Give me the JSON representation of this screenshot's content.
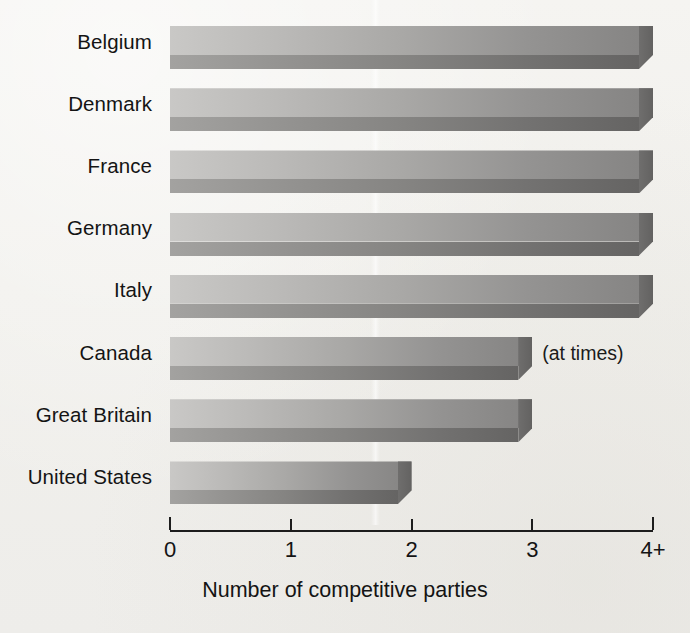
{
  "chart_data": {
    "type": "bar",
    "orientation": "horizontal",
    "title": "",
    "xlabel": "Number of competitive parties",
    "ylabel": "",
    "xlim": [
      0,
      4
    ],
    "grid": false,
    "legend": false,
    "axis_tick_labels": [
      "0",
      "1",
      "2",
      "3",
      "4+"
    ],
    "axis_tick_values": [
      0,
      1,
      2,
      3,
      4
    ],
    "categories": [
      "Belgium",
      "Denmark",
      "France",
      "Germany",
      "Italy",
      "Canada",
      "Great Britain",
      "United States"
    ],
    "values": [
      4,
      4,
      4,
      4,
      4,
      3,
      3,
      2
    ],
    "value_labels": [
      "4+",
      "4+",
      "4+",
      "4+",
      "4+",
      "3",
      "3",
      "2"
    ],
    "annotations": [
      {
        "category": "Canada",
        "text": "(at times)"
      }
    ],
    "colors": {
      "bar_face_light": "#c9c8c6",
      "bar_face_dark": "#848382",
      "bar_shadow_light": "#a3a2a0",
      "bar_shadow_dark": "#656463",
      "axis": "#1d1d1d",
      "text": "#141414",
      "background": "#f3f2ef"
    }
  },
  "figure": {
    "axis_title": "Number of competitive parties",
    "bars": [
      {
        "label": "Belgium",
        "value": 4,
        "note": ""
      },
      {
        "label": "Denmark",
        "value": 4,
        "note": ""
      },
      {
        "label": "France",
        "value": 4,
        "note": ""
      },
      {
        "label": "Germany",
        "value": 4,
        "note": ""
      },
      {
        "label": "Italy",
        "value": 4,
        "note": ""
      },
      {
        "label": "Canada",
        "value": 3,
        "note": "(at times)"
      },
      {
        "label": "Great Britain",
        "value": 3,
        "note": ""
      },
      {
        "label": "United States",
        "value": 2,
        "note": ""
      }
    ],
    "ticks": [
      {
        "label": "0",
        "value": 0
      },
      {
        "label": "1",
        "value": 1
      },
      {
        "label": "2",
        "value": 2
      },
      {
        "label": "3",
        "value": 3
      },
      {
        "label": "4+",
        "value": 4
      }
    ]
  }
}
